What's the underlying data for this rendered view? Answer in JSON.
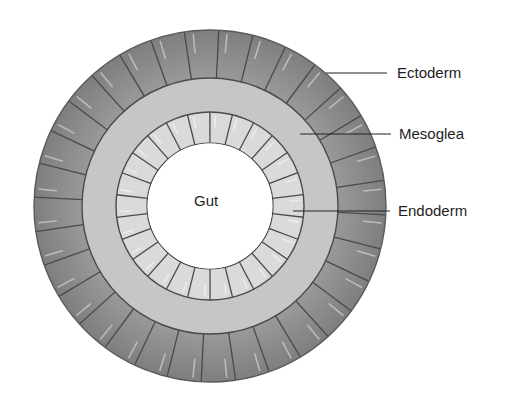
{
  "diagram": {
    "type": "cross-section",
    "center": {
      "x": 210,
      "y": 206
    },
    "layers": {
      "ectoderm": {
        "label": "Ectoderm",
        "outer_r": 176,
        "inner_r": 128,
        "cells": 32,
        "color": "#8c8c8c"
      },
      "mesoglea": {
        "label": "Mesoglea",
        "outer_r": 128,
        "inner_r": 94,
        "color": "#c6c6c6"
      },
      "endoderm": {
        "label": "Endoderm",
        "outer_r": 94,
        "inner_r": 63,
        "cells": 26,
        "color": "#dadada"
      },
      "gut": {
        "label": "Gut",
        "r": 63,
        "color": "#ffffff"
      }
    },
    "outline_color": "#4a4a4a",
    "callouts": [
      {
        "name": "ectoderm",
        "label": "Ectoderm",
        "x1": 326,
        "y1": 73,
        "x2": 387,
        "y2": 73,
        "tx": 397,
        "ty": 78
      },
      {
        "name": "mesoglea",
        "label": "Mesoglea",
        "x1": 300,
        "y1": 134,
        "x2": 391,
        "y2": 134,
        "tx": 399,
        "ty": 139
      },
      {
        "name": "endoderm",
        "label": "Endoderm",
        "x1": 293,
        "y1": 211,
        "x2": 390,
        "y2": 211,
        "tx": 398,
        "ty": 216
      }
    ]
  }
}
